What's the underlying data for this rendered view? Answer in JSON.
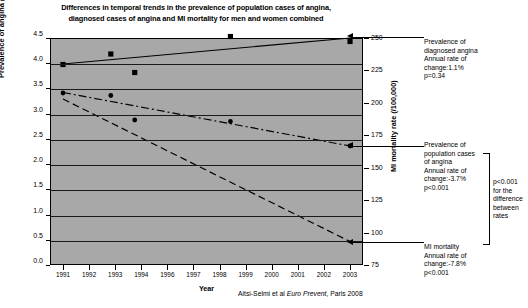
{
  "chart": {
    "title": "Differences in temporal trends in the prevalence of population cases of angina, diagnosed cases of angina and MI mortality for men and women combined",
    "title_line1": "Differences in temporal trends in the prevalence of population cases of angina,",
    "title_line2": "diagnosed cases of angina and MI mortality for men and women combined",
    "citation_prefix": "Aitsi-Selmi et al ",
    "citation_italic": "Euro Prevent",
    "citation_suffix": ", Paris 2008",
    "xlabel": "Year",
    "ylabel_left": "Prevalence of angina (%)",
    "ylabel_right": "MI mortality rate (/100,000)"
  },
  "annotations": {
    "diagnosed": {
      "line1": "Prevalence of",
      "line2": "diagnosed angina",
      "line3": "Annual rate of",
      "line4": "change:1.1%",
      "line5": "p=0.34"
    },
    "population": {
      "line1": "Prevalence of",
      "line2": "population cases",
      "line3": "of angina",
      "line4": "Annual rate of",
      "line5": "change:-3.7%",
      "line6": "p<0.001"
    },
    "mortality": {
      "line1": "MI mortality",
      "line2": "Annual rate of",
      "line3": "change:-7.8%",
      "line4": "p<0.001"
    },
    "brace": {
      "line1": "p<0.001",
      "line2": "for the",
      "line3": "difference",
      "line4": "between",
      "line5": "rates"
    }
  },
  "chart_data": {
    "type": "scatter",
    "title": "Differences in temporal trends in the prevalence of population cases of angina, diagnosed cases of angina and MI mortality for men and women combined",
    "xlabel": "Year",
    "ylabel": "Prevalence of angina (%)",
    "ylabel_secondary": "MI mortality rate (/100,000)",
    "xlim": [
      1990.5,
      2003.5
    ],
    "ylim": [
      0.0,
      4.5
    ],
    "ylim_secondary": [
      75,
      250
    ],
    "grid": true,
    "legend": "none (annotated labels at right)",
    "xticklabels": [
      "1991",
      "1992",
      "1993",
      "1994",
      "1996",
      "1997",
      "1998",
      "1999",
      "2000",
      "2001",
      "2002",
      "2003"
    ],
    "yticklabels_left": [
      "0.0",
      "0.5",
      "1.0",
      "1.5",
      "2.0",
      "2.5",
      "3.0",
      "3.5",
      "4.0",
      "4.5"
    ],
    "yticklabels_right": [
      "75",
      "100",
      "125",
      "150",
      "175",
      "200",
      "225",
      "250"
    ],
    "series": [
      {
        "name": "Prevalence of diagnosed angina",
        "marker": "square",
        "linestyle": "solid",
        "axis": "left",
        "annual_rate_of_change": "1.1%",
        "p_value": "p=0.34",
        "points": [
          {
            "x": 1991,
            "y": 3.99
          },
          {
            "x": 1993,
            "y": 4.2
          },
          {
            "x": 1994,
            "y": 3.83
          },
          {
            "x": 1998,
            "y": 4.55
          },
          {
            "x": 2003,
            "y": 4.45
          }
        ],
        "trend": [
          {
            "x": 1991,
            "y": 4.0
          },
          {
            "x": 2003,
            "y": 4.52
          }
        ]
      },
      {
        "name": "Prevalence of population cases of angina",
        "marker": "circle",
        "linestyle": "dash-dot",
        "axis": "left",
        "annual_rate_of_change": "-3.7%",
        "p_value": "p<0.001",
        "points": [
          {
            "x": 1991,
            "y": 3.42
          },
          {
            "x": 1993,
            "y": 3.37
          },
          {
            "x": 1994,
            "y": 2.88
          },
          {
            "x": 1998,
            "y": 2.85
          },
          {
            "x": 2003,
            "y": 2.36
          }
        ],
        "trend": [
          {
            "x": 1991,
            "y": 3.43
          },
          {
            "x": 2003,
            "y": 2.36
          }
        ]
      },
      {
        "name": "MI mortality",
        "marker": "none",
        "linestyle": "dashed",
        "axis": "right",
        "annual_rate_of_change": "-7.8%",
        "p_value": "p<0.001",
        "trend": [
          {
            "x": 1991,
            "y": 3.3
          },
          {
            "x": 2003,
            "y": 0.45
          }
        ],
        "trend_secondary_units": [
          {
            "x": 1991,
            "y": 203
          },
          {
            "x": 2003,
            "y": 92
          }
        ]
      }
    ]
  }
}
